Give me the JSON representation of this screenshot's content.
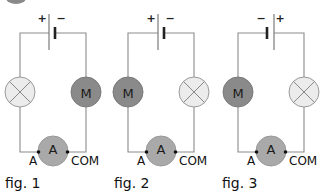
{
  "header": {
    "clipped_badge_color": "#8a8a8a"
  },
  "symbols": {
    "motor": "M",
    "ammeter": "A"
  },
  "figures": [
    {
      "label": "fig. 1",
      "left_component": "lamp",
      "right_component": "motor",
      "polarity_left": "+",
      "polarity_right": "−",
      "terminal_left": "A",
      "terminal_right": "COM"
    },
    {
      "label": "fig. 2",
      "left_component": "motor",
      "right_component": "lamp",
      "polarity_left": "+",
      "polarity_right": "−",
      "terminal_left": "A",
      "terminal_right": "COM"
    },
    {
      "label": "fig. 3",
      "left_component": "motor",
      "right_component": "lamp",
      "polarity_left": "−",
      "polarity_right": "+",
      "terminal_left": "A",
      "terminal_right": "COM"
    }
  ],
  "colors": {
    "wire": "#8c8c8c",
    "lamp": "#ececec",
    "motor": "#8a8a8a",
    "ammeter": "#a9a9a9"
  }
}
